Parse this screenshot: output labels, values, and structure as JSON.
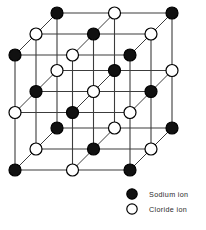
{
  "figure": {
    "name": "sodium-chloride-crystal-lattice",
    "background_color": "#ffffff",
    "bond_color": "#3c3c3c",
    "outline_color": "#000000"
  },
  "lattice": {
    "grid_size": 3,
    "front_face": {
      "origin_x": 15,
      "origin_y": 55,
      "step_x": 57.5,
      "step_y": 57.5
    },
    "depth_offset": {
      "dx": 21,
      "dy": -21,
      "layers": 3
    },
    "ion_radius": 6.0,
    "ion_types": {
      "sodium": {
        "key": "Na",
        "fill": "#111111",
        "stroke": "#000000"
      },
      "chloride": {
        "key": "Cl",
        "fill": "#ffffff",
        "stroke": "#000000"
      }
    },
    "pattern_rule": "ion is sodium when (column + row + layer) is even, chloride otherwise",
    "corner_ion": "sodium"
  },
  "legend": {
    "name": "ion-legend",
    "x": 132,
    "y": 194,
    "row_spacing": 15,
    "marker_radius": 5.2,
    "label_offset_x": 17,
    "items": [
      {
        "marker": "filled-circle-marker",
        "ion": "sodium",
        "label": "Sodium ion"
      },
      {
        "marker": "hollow-circle-marker",
        "ion": "chloride",
        "label": "Cloride ion"
      }
    ]
  }
}
